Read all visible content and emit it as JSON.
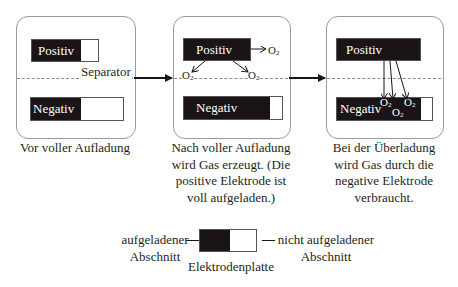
{
  "panels": [
    {
      "positive_label": "Positiv",
      "negative_label": "Negativ",
      "separator_label": "Separator",
      "caption": "Vor voller Aufladung"
    },
    {
      "positive_label": "Positiv",
      "negative_label": "Negativ",
      "gas_labels": [
        "O2",
        "O2",
        "O2"
      ],
      "caption_lines": [
        "Nach voller Aufladung",
        "wird Gas erzeugt. (Die",
        "positive Elektrode ist",
        "voll aufgeladen.)"
      ]
    },
    {
      "positive_label": "Positiv",
      "negative_label": "Negativ",
      "gas_labels": [
        "O2",
        "O2",
        "O2"
      ],
      "caption_lines": [
        "Bei der Überladung",
        "wird Gas durch die",
        "negative Elektrode",
        "verbraucht."
      ]
    }
  ],
  "legend": {
    "charged_lines": [
      "aufgeladener",
      "Abschnitt"
    ],
    "uncharged_lines": [
      "nicht aufgeladener",
      "Abschnitt"
    ],
    "plate_label": "Elektrodenplatte"
  },
  "gas_symbol": {
    "base": "O",
    "subscript": "2"
  },
  "colors": {
    "charged": "#1a1416",
    "uncharged": "#ffffff",
    "border": "#9a9a9a",
    "separator": "#8a8a8a"
  }
}
